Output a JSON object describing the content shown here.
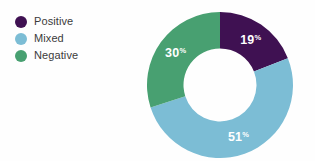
{
  "chart_data": {
    "type": "pie",
    "variant": "donut",
    "title": "",
    "subtitle": "",
    "xlabel": "",
    "ylabel": "",
    "value_suffix": "%",
    "hole_ratio": 0.5,
    "start_angle_deg": 0,
    "direction": "clockwise",
    "legend_position": "left",
    "grid": false,
    "categories": [
      "Positive",
      "Mixed",
      "Negative"
    ],
    "values": [
      19,
      51,
      30
    ],
    "colors": [
      "#3f1152",
      "#7cbdd5",
      "#48a071"
    ],
    "slices": [
      {
        "label": "Positive",
        "value": 19,
        "value_text": "19",
        "suffix": "%",
        "color": "#3f1152",
        "label_color": "#ffffff"
      },
      {
        "label": "Mixed",
        "value": 51,
        "value_text": "51",
        "suffix": "%",
        "color": "#7cbdd5",
        "label_color": "#ffffff"
      },
      {
        "label": "Negative",
        "value": 30,
        "value_text": "30",
        "suffix": "%",
        "color": "#48a071",
        "label_color": "#ffffff"
      }
    ]
  },
  "legend": {
    "items": [
      {
        "label": "Positive",
        "color": "#3f1152"
      },
      {
        "label": "Mixed",
        "color": "#7cbdd5"
      },
      {
        "label": "Negative",
        "color": "#48a071"
      }
    ]
  },
  "theme": {
    "background": "#fefefe",
    "text_color": "#3b3b3b",
    "hole_color": "#ffffff"
  }
}
